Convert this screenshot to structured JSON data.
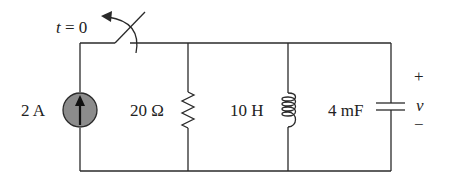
{
  "diagram": {
    "type": "circuit",
    "topology": "parallel RLC with current source and switch",
    "switch": {
      "label": "t = 0",
      "action": "opens at t = 0"
    },
    "components": [
      {
        "id": "source",
        "kind": "current-source",
        "label": "2 A",
        "direction": "up"
      },
      {
        "id": "resistor",
        "kind": "resistor",
        "label": "20 Ω"
      },
      {
        "id": "inductor",
        "kind": "inductor",
        "label": "10 H"
      },
      {
        "id": "capacitor",
        "kind": "capacitor",
        "label": "4 mF"
      }
    ],
    "voltage": {
      "symbol": "v",
      "plus": "+",
      "minus": "−"
    }
  },
  "colors": {
    "wire": "#2a2a2a",
    "source_fill": "#8c8c8c",
    "background": "#ffffff"
  }
}
